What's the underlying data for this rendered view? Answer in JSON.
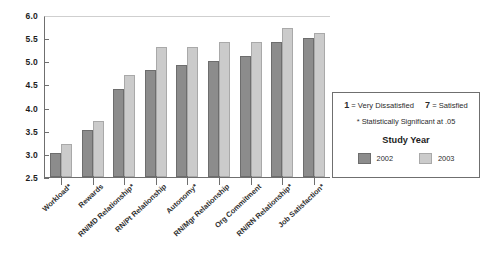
{
  "chart_data": {
    "type": "bar",
    "title": "",
    "xlabel": "",
    "ylabel": "",
    "ylim": [
      2.5,
      6.0
    ],
    "ytick_values": [
      "6.0",
      "5.5",
      "5.0",
      "4.5",
      "4.0",
      "3.5",
      "3.0",
      "2.5"
    ],
    "grid": false,
    "legend_position": "right",
    "categories": [
      "Workload*",
      "Rewards",
      "RN/MD Relationship*",
      "RN/Pt Relationship",
      "Autonomy*",
      "RN/Mgr Relationship",
      "Org Commitment",
      "RN/RN Relationship*",
      "Job Satisfaction*"
    ],
    "series": [
      {
        "name": "2002",
        "color": "#8c8c8c",
        "values": [
          3.0,
          3.5,
          4.4,
          4.8,
          4.9,
          5.0,
          5.1,
          5.4,
          5.5
        ]
      },
      {
        "name": "2003",
        "color": "#cbcbcb",
        "values": [
          3.2,
          3.7,
          4.7,
          5.3,
          5.3,
          5.4,
          5.4,
          5.7,
          5.6
        ]
      }
    ]
  },
  "legend": {
    "scale_low": "1 = Very Dissatisfied",
    "scale_high": "7 = Satisfied",
    "significance_note": "* Statistically Significant at .05",
    "title": "Study Year",
    "keys": [
      {
        "label": "2002",
        "color": "#8c8c8c"
      },
      {
        "label": "2003",
        "color": "#cbcbcb"
      }
    ]
  },
  "colors": {
    "axis": "#6f6f6f",
    "series_2002": "#8c8c8c",
    "series_2003": "#cbcbcb",
    "text": "#2b2b2b",
    "background": "#ffffff"
  }
}
